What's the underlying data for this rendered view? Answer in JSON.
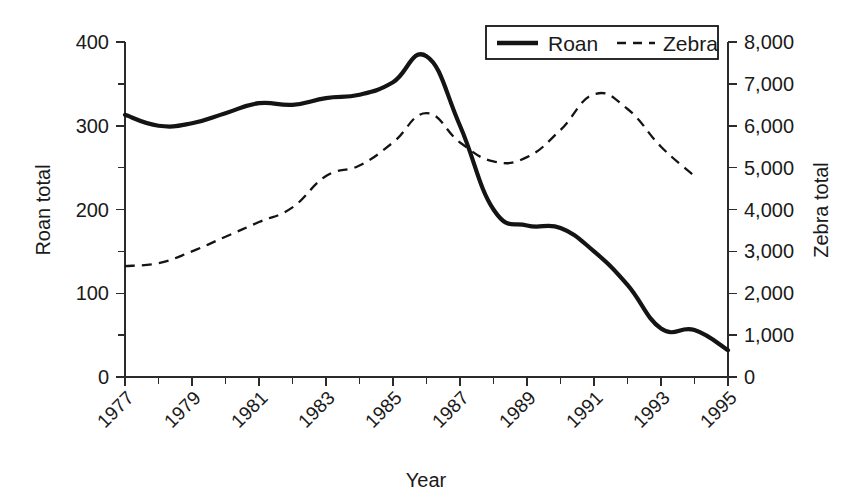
{
  "chart_data": {
    "type": "line",
    "title": "",
    "xlabel": "Year",
    "ylabel": "Roan total",
    "y2label": "Zebra total",
    "grid": false,
    "legend_position": "top-center-right",
    "x": [
      1977,
      1978,
      1979,
      1980,
      1981,
      1982,
      1983,
      1984,
      1985,
      1986,
      1987,
      1988,
      1989,
      1990,
      1991,
      1992,
      1993,
      1994,
      1995
    ],
    "xlim": [
      1977,
      1995
    ],
    "xtick_labels": [
      "1977",
      "1979",
      "1981",
      "1983",
      "1985",
      "1987",
      "1989",
      "1991",
      "1993",
      "1995"
    ],
    "xtick_values": [
      1977,
      1979,
      1981,
      1983,
      1985,
      1987,
      1989,
      1991,
      1993,
      1995
    ],
    "xtick_all": [
      1977,
      1978,
      1979,
      1980,
      1981,
      1982,
      1983,
      1984,
      1985,
      1986,
      1987,
      1988,
      1989,
      1990,
      1991,
      1992,
      1993,
      1994,
      1995
    ],
    "ylim": [
      0,
      400
    ],
    "ytick_labels": [
      "0",
      "100",
      "200",
      "300",
      "400"
    ],
    "ytick_values": [
      0,
      100,
      200,
      300,
      400
    ],
    "ytick_minor": [
      50,
      150,
      250,
      350
    ],
    "y2lim": [
      0,
      8000
    ],
    "y2tick_labels": [
      "0",
      "1,000",
      "2,000",
      "3,000",
      "4,000",
      "5,000",
      "6,000",
      "7,000",
      "8,000"
    ],
    "y2tick_values": [
      0,
      1000,
      2000,
      3000,
      4000,
      5000,
      6000,
      7000,
      8000
    ],
    "series": [
      {
        "name": "Roan",
        "axis": "left",
        "style": "solid",
        "color": "#141414",
        "values": [
          313,
          300,
          303,
          315,
          327,
          325,
          333,
          337,
          352,
          383,
          300,
          200,
          181,
          178,
          150,
          110,
          58,
          56,
          32
        ]
      },
      {
        "name": "Zebra",
        "axis": "right",
        "style": "dashed",
        "color": "#141414",
        "values": [
          2650,
          2720,
          3000,
          3350,
          3700,
          4050,
          4800,
          5050,
          5600,
          6300,
          5600,
          5150,
          5250,
          5900,
          6750,
          6400,
          5500,
          4800,
          null
        ]
      }
    ]
  },
  "legend": {
    "entries": [
      {
        "label": "Roan",
        "style": "solid"
      },
      {
        "label": "Zebra",
        "style": "dashed"
      }
    ]
  },
  "axes": {
    "left_title": "Roan total",
    "right_title": "Zebra total",
    "bottom_title": "Year"
  }
}
